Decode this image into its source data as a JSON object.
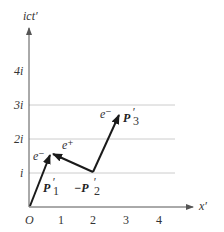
{
  "diagram": {
    "axes": {
      "x_label": "x′",
      "y_label": "ict′",
      "origin_label": "O",
      "x_ticks": [
        "1",
        "2",
        "3",
        "4"
      ],
      "y_ticks": [
        "i",
        "2i",
        "3i",
        "4i"
      ]
    },
    "vectors": [
      {
        "label": "P′₁",
        "from": [
          0,
          0
        ],
        "to": [
          0.65,
          1.6
        ]
      },
      {
        "label": "−P′₂",
        "from": [
          2,
          1
        ],
        "to": [
          0.65,
          1.6
        ]
      },
      {
        "label": "P′₃",
        "from": [
          2,
          1
        ],
        "to": [
          2.85,
          2.8
        ]
      }
    ],
    "particle_labels": {
      "e_minus_1": "e⁻",
      "e_plus": "e⁺",
      "e_minus_2": "e⁻"
    },
    "vector_labels": {
      "p1": "P",
      "p1_sub": "1",
      "p2_prefix": "−P",
      "p2_sub": "2",
      "p3": "P",
      "p3_sub": "3",
      "prime": "′"
    },
    "colors": {
      "axis": "#555555",
      "grid": "#cccccc",
      "vector": "#1a1a1a"
    }
  }
}
